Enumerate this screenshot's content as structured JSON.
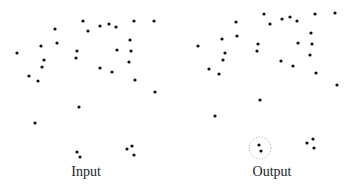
{
  "panels": [
    {
      "label": "Input",
      "label_pos": [
        86,
        166
      ],
      "points": [
        [
          83,
          21
        ],
        [
          154,
          21
        ],
        [
          134,
          21
        ],
        [
          55,
          29
        ],
        [
          100,
          26
        ],
        [
          109,
          24
        ],
        [
          116,
          27
        ],
        [
          88,
          31
        ],
        [
          130,
          40
        ],
        [
          41,
          46
        ],
        [
          57,
          43
        ],
        [
          17,
          53
        ],
        [
          77,
          51
        ],
        [
          117,
          50
        ],
        [
          131,
          51
        ],
        [
          76,
          58
        ],
        [
          44,
          60
        ],
        [
          129,
          62
        ],
        [
          42,
          67
        ],
        [
          100,
          68
        ],
        [
          112,
          72
        ],
        [
          29,
          76
        ],
        [
          38,
          81
        ],
        [
          135,
          80
        ],
        [
          155,
          92
        ],
        [
          79,
          107
        ],
        [
          35,
          123
        ],
        [
          77,
          152
        ],
        [
          80,
          157
        ],
        [
          127,
          149
        ],
        [
          132,
          146
        ],
        [
          134,
          155
        ]
      ],
      "highlight": null
    },
    {
      "label": "Output",
      "label_pos": [
        272,
        166
      ],
      "points": [
        [
          264,
          14
        ],
        [
          335,
          13
        ],
        [
          315,
          14
        ],
        [
          236,
          22
        ],
        [
          282,
          19
        ],
        [
          290,
          17
        ],
        [
          297,
          21
        ],
        [
          270,
          24
        ],
        [
          311,
          33
        ],
        [
          222,
          39
        ],
        [
          237,
          36
        ],
        [
          198,
          46
        ],
        [
          258,
          44
        ],
        [
          298,
          43
        ],
        [
          312,
          44
        ],
        [
          257,
          51
        ],
        [
          225,
          53
        ],
        [
          310,
          55
        ],
        [
          223,
          60
        ],
        [
          281,
          61
        ],
        [
          293,
          66
        ],
        [
          209,
          69
        ],
        [
          219,
          74
        ],
        [
          316,
          73
        ],
        [
          337,
          85
        ],
        [
          260,
          100
        ],
        [
          215,
          116
        ],
        [
          259,
          145
        ],
        [
          261,
          151
        ],
        [
          307,
          143
        ],
        [
          313,
          139
        ],
        [
          314,
          148
        ]
      ],
      "highlight": {
        "cx": 260,
        "cy": 148,
        "r": 11
      }
    }
  ],
  "colors": {
    "point": "#111111",
    "highlight": "#999999"
  }
}
